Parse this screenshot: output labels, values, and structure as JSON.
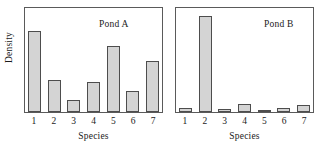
{
  "figure": {
    "ylabel": "Density",
    "xlabel": "Species",
    "categories": [
      "1",
      "2",
      "3",
      "4",
      "5",
      "6",
      "7"
    ],
    "bar_fill": "#d4d4d4",
    "bar_edge": "#4d4d4d",
    "frame_color": "#5a5a5a"
  },
  "panels": [
    {
      "title": "Pond A",
      "xlabel": "Species",
      "ylabel": "Density"
    },
    {
      "title": "Pond B",
      "xlabel": "Species",
      "ylabel": ""
    }
  ],
  "chart_data": [
    {
      "type": "bar",
      "title": "Pond A",
      "xlabel": "Species",
      "ylabel": "Density",
      "categories": [
        "1",
        "2",
        "3",
        "4",
        "5",
        "6",
        "7"
      ],
      "values": [
        0.78,
        0.31,
        0.12,
        0.29,
        0.63,
        0.2,
        0.49
      ],
      "ylim": [
        0,
        1
      ],
      "grid": false,
      "legend": "none"
    },
    {
      "type": "bar",
      "title": "Pond B",
      "xlabel": "Species",
      "ylabel": "",
      "categories": [
        "1",
        "2",
        "3",
        "4",
        "5",
        "6",
        "7"
      ],
      "values": [
        0.04,
        0.92,
        0.03,
        0.08,
        0.02,
        0.04,
        0.07
      ],
      "ylim": [
        0,
        1
      ],
      "grid": false,
      "legend": "none"
    }
  ]
}
